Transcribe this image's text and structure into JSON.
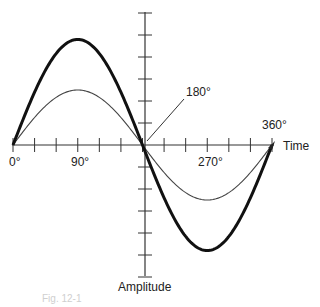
{
  "figure": {
    "x_axis_label": "Time",
    "y_axis_label": "Amplitude",
    "angle_labels": {
      "deg0": "0°",
      "deg90": "90°",
      "deg180": "180°",
      "deg270": "270°",
      "deg360": "360°"
    },
    "caption": "Fig. 12-1"
  },
  "chart_data": {
    "type": "line",
    "title": "",
    "xlabel": "Time",
    "ylabel": "Amplitude",
    "x": [
      0,
      90,
      180,
      270,
      360
    ],
    "x_unit": "degrees",
    "tick_labels_x": [
      "0°",
      "90°",
      "180°",
      "270°",
      "360°"
    ],
    "series": [
      {
        "name": "large-amplitude sine",
        "style": "thick",
        "values": [
          0,
          4.8,
          0,
          -4.8,
          0
        ]
      },
      {
        "name": "small-amplitude sine",
        "style": "thin",
        "values": [
          0,
          2.5,
          0,
          -2.5,
          0
        ]
      }
    ],
    "grid": false,
    "legend": "none",
    "annotations": [
      "180° (leader line to zero crossing)",
      "360°"
    ],
    "x_ticks_count": 13,
    "y_ticks_above": 6,
    "y_ticks_below": 6
  }
}
